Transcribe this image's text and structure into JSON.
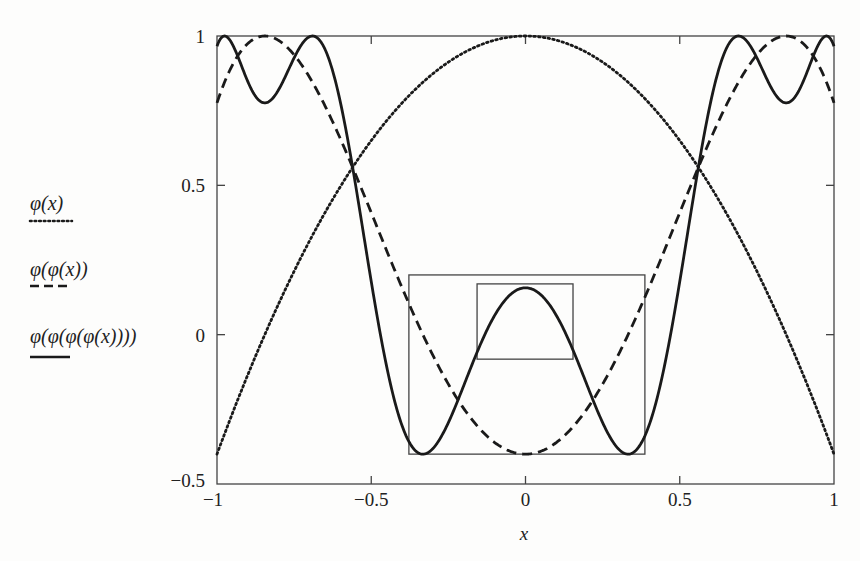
{
  "chart_data": {
    "type": "line",
    "title": "",
    "xlabel": "x",
    "ylabel": "",
    "xlim": [
      -1,
      1
    ],
    "ylim": [
      -0.5,
      1
    ],
    "grid": false,
    "legend_position": "left-outside",
    "map": "phi(x) = 1 - 1.4 x^2",
    "x_ticks": [
      {
        "value": -1,
        "label": "−1"
      },
      {
        "value": -0.5,
        "label": "−0.5"
      },
      {
        "value": 0,
        "label": "0"
      },
      {
        "value": 0.5,
        "label": "0.5"
      },
      {
        "value": 1,
        "label": "1"
      }
    ],
    "y_ticks": [
      {
        "value": -0.5,
        "label": "−0.5"
      },
      {
        "value": 0,
        "label": "0"
      },
      {
        "value": 0.5,
        "label": "0.5"
      },
      {
        "value": 1,
        "label": "1"
      }
    ],
    "x": [
      -1,
      -0.75,
      -0.5,
      -0.25,
      0,
      0.25,
      0.5,
      0.75,
      1
    ],
    "series": [
      {
        "name": "φ(x)",
        "style": "dotted",
        "iterations": 1,
        "values": [
          -0.4,
          0.2125,
          0.65,
          0.9125,
          1,
          0.9125,
          0.65,
          0.2125,
          -0.4
        ]
      },
      {
        "name": "φ(φ(x))",
        "style": "dashed",
        "iterations": 2,
        "values": [
          0.776,
          0.937,
          0.409,
          -0.166,
          -0.4,
          -0.166,
          0.409,
          0.937,
          0.776
        ]
      },
      {
        "name": "φ(φ(φ(φ(x))))",
        "style": "solid",
        "iterations": 4,
        "values": [
          0.157,
          0.927,
          0.178,
          -0.295,
          0.157,
          -0.295,
          0.178,
          0.927,
          0.157
        ]
      }
    ],
    "annotations": [
      {
        "type": "rect",
        "name": "outer-renormalization-box",
        "x0": -0.378,
        "x1": 0.387,
        "y0": -0.4,
        "y1": 0.2
      },
      {
        "type": "rect",
        "name": "inner-renormalization-box",
        "x0": -0.157,
        "x1": 0.154,
        "y0": -0.082,
        "y1": 0.17
      }
    ]
  },
  "legend": [
    {
      "label": "φ(x)",
      "style": "dotted"
    },
    {
      "label": "φ(φ(x))",
      "style": "dashed"
    },
    {
      "label": "φ(φ(φ(φ(x))))",
      "style": "solid"
    }
  ],
  "colors": {
    "background": "#fdfdfc",
    "line": "#1a1a1a",
    "axis": "#444444"
  }
}
